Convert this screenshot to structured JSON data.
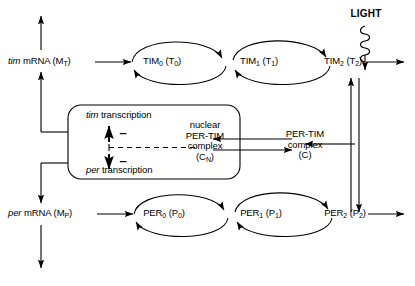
{
  "diagram": {
    "type": "pathway-diagram",
    "stroke_color": "#000000",
    "background_color": "#ffffff"
  },
  "light": {
    "label": "LIGHT",
    "arrow_style": "coiled-squiggle-down"
  },
  "tim_pathway": {
    "mrna_label_italic": "tim",
    "mrna_label_rest": " mRNA (M",
    "mrna_label_sub": "T",
    "mrna_label_close": ")",
    "states": [
      {
        "name": "TIM",
        "sub": "0",
        "paren_open": " (T",
        "paren_sub": "0",
        "paren_close": ")"
      },
      {
        "name": "TIM",
        "sub": "1",
        "paren_open": " (T",
        "paren_sub": "1",
        "paren_close": ")"
      },
      {
        "name": "TIM",
        "sub": "2",
        "paren_open": " (T",
        "paren_sub": "2",
        "paren_close": ")"
      }
    ]
  },
  "per_pathway": {
    "mrna_label_italic": "per",
    "mrna_label_rest": " mRNA (M",
    "mrna_label_sub": "P",
    "mrna_label_close": ")",
    "states": [
      {
        "name": "PER",
        "sub": "0",
        "paren_open": " (P",
        "paren_sub": "0",
        "paren_close": ")"
      },
      {
        "name": "PER",
        "sub": "1",
        "paren_open": " (P",
        "paren_sub": "1",
        "paren_close": ")"
      },
      {
        "name": "PER",
        "sub": "2",
        "paren_open": " (P",
        "paren_sub": "2",
        "paren_close": ")"
      }
    ]
  },
  "nucleus_box": {
    "tim_transcription_italic": "tim",
    "tim_transcription_rest": " transcription",
    "per_transcription_italic": "per",
    "per_transcription_rest": " transcription",
    "inhibition_symbol_up": "–",
    "inhibition_symbol_down": "–",
    "nuclear_complex": {
      "line1": "nuclear",
      "line2": "PER-TIM",
      "line3": "complex",
      "line4_open": "(C",
      "line4_sub": "N",
      "line4_close": ")"
    }
  },
  "cytoplasmic_complex": {
    "line1": "PER-TIM",
    "line2": "complex",
    "line3": "(C)"
  }
}
